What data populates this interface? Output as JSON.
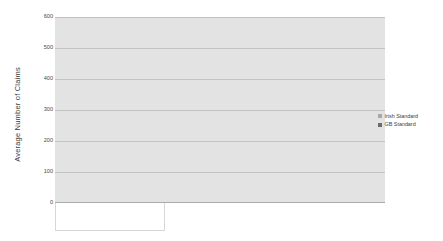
{
  "chart_data": {
    "type": "bar",
    "title": "",
    "xlabel": "",
    "ylabel": "Average Number of Claims",
    "ylim": [
      0,
      600
    ],
    "yticks": [
      0,
      100,
      200,
      300,
      400,
      500,
      600
    ],
    "grid": true,
    "legend_position": "right",
    "groups": [
      "Men",
      "Single women",
      "Married women"
    ],
    "subcategories": [
      "SB",
      "GB"
    ],
    "categories": [
      "Men / SB",
      "Men / GB",
      "Single women / SB",
      "Single women / GB",
      "Married women / SB",
      "Married women / GB"
    ],
    "series": [
      {
        "name": "Irish Standard",
        "color": "#a8a8a8",
        "values": [
          95,
          200,
          105,
          450,
          125,
          590
        ]
      },
      {
        "name": "GB Standard",
        "color": "#6b6b6b",
        "values": [
          80,
          200,
          125,
          225,
          100,
          255
        ]
      }
    ]
  },
  "axis": {
    "y_title": "Average Number of Claims",
    "y_tick_labels": [
      "600",
      "500",
      "400",
      "300",
      "200",
      "100",
      "0"
    ]
  },
  "legend": {
    "items": [
      {
        "label": "Irish Standard",
        "color": "#a8a8a8"
      },
      {
        "label": "GB Standard",
        "color": "#6b6b6b"
      }
    ]
  },
  "groups": [
    {
      "label": "Men",
      "sublabels": [
        "SB",
        "GB"
      ]
    },
    {
      "label": "Single women",
      "sublabels": [
        "SB",
        "GB"
      ]
    },
    {
      "label": "Married women",
      "sublabels": [
        "SB",
        "GB"
      ]
    }
  ],
  "colors": {
    "plot_background": "#e3e3e3",
    "gridline": "#c3c3c3",
    "irish_standard": "#a8a8a8",
    "gb_standard": "#6b6b6b",
    "text": "#4a4a4a"
  }
}
